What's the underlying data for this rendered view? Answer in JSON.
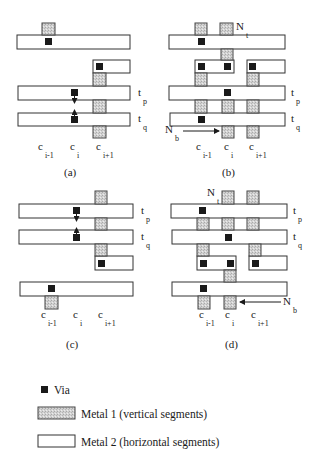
{
  "figure": {
    "panels": [
      {
        "id": "a",
        "caption": "(a)",
        "metal2": [
          {
            "x": 17,
            "y": 35,
            "w": 113,
            "h": 14
          },
          {
            "x": 93,
            "y": 60,
            "w": 37,
            "h": 13
          },
          {
            "x": 18,
            "y": 86,
            "w": 112,
            "h": 14
          },
          {
            "x": 18,
            "y": 113,
            "w": 112,
            "h": 13
          }
        ],
        "metal1": [
          {
            "x": 42,
            "y": 23,
            "w": 13,
            "h": 12
          },
          {
            "x": 93,
            "y": 73,
            "w": 13,
            "h": 13
          },
          {
            "x": 93,
            "y": 100,
            "w": 13,
            "h": 13
          },
          {
            "x": 93,
            "y": 126,
            "w": 13,
            "h": 12
          }
        ],
        "vias": [
          {
            "x": 45,
            "y": 38
          },
          {
            "x": 96,
            "y": 63
          },
          {
            "x": 71,
            "y": 89
          },
          {
            "x": 71,
            "y": 116
          }
        ],
        "arrows": [
          {
            "x1": 74.5,
            "y1": 96,
            "x2": 74.5,
            "y2": 103
          },
          {
            "x1": 74.5,
            "y1": 119,
            "x2": 74.5,
            "y2": 110
          }
        ],
        "track_labels": [
          {
            "main": "t",
            "sub": "p",
            "x": 138,
            "y": 96
          },
          {
            "main": "t",
            "sub": "q",
            "x": 138,
            "y": 122
          }
        ],
        "column_labels": [
          {
            "main": "c",
            "sub": "i-1",
            "x": 38,
            "y": 150
          },
          {
            "main": "c",
            "sub": "i",
            "x": 70,
            "y": 150
          },
          {
            "main": "c",
            "sub": "i+1",
            "x": 96,
            "y": 150
          }
        ],
        "net_labels": [],
        "caption_pos": {
          "x": 64,
          "y": 176
        }
      },
      {
        "id": "b",
        "caption": "(b)",
        "metal2": [
          {
            "x": 169,
            "y": 35,
            "w": 116,
            "h": 14
          },
          {
            "x": 195,
            "y": 60,
            "w": 39,
            "h": 13
          },
          {
            "x": 247,
            "y": 60,
            "w": 38,
            "h": 13
          },
          {
            "x": 169,
            "y": 86,
            "w": 116,
            "h": 14
          },
          {
            "x": 170,
            "y": 113,
            "w": 115,
            "h": 13
          }
        ],
        "metal1": [
          {
            "x": 195,
            "y": 23,
            "w": 12,
            "h": 12
          },
          {
            "x": 220,
            "y": 23,
            "w": 13,
            "h": 12
          },
          {
            "x": 221,
            "y": 49,
            "w": 12,
            "h": 11
          },
          {
            "x": 195,
            "y": 73,
            "w": 12,
            "h": 13
          },
          {
            "x": 247,
            "y": 73,
            "w": 12,
            "h": 13
          },
          {
            "x": 195,
            "y": 100,
            "w": 12,
            "h": 13
          },
          {
            "x": 222,
            "y": 100,
            "w": 12,
            "h": 13
          },
          {
            "x": 247,
            "y": 100,
            "w": 12,
            "h": 13
          },
          {
            "x": 222,
            "y": 126,
            "w": 12,
            "h": 12
          },
          {
            "x": 247,
            "y": 126,
            "w": 12,
            "h": 12
          }
        ],
        "vias": [
          {
            "x": 198,
            "y": 38
          },
          {
            "x": 198,
            "y": 63
          },
          {
            "x": 224,
            "y": 63
          },
          {
            "x": 249,
            "y": 63
          },
          {
            "x": 224,
            "y": 89
          },
          {
            "x": 198,
            "y": 116
          }
        ],
        "arrows": [
          {
            "x1": 183,
            "y1": 131,
            "x2": 219,
            "y2": 131
          }
        ],
        "track_labels": [
          {
            "main": "t",
            "sub": "p",
            "x": 291,
            "y": 96
          },
          {
            "main": "t",
            "sub": "q",
            "x": 291,
            "y": 122
          }
        ],
        "column_labels": [
          {
            "main": "c",
            "sub": "i-1",
            "x": 196,
            "y": 150
          },
          {
            "main": "c",
            "sub": "i",
            "x": 224,
            "y": 150
          },
          {
            "main": "c",
            "sub": "i+1",
            "x": 249,
            "y": 150
          }
        ],
        "net_labels": [
          {
            "main": "N",
            "sub": "t",
            "x": 236,
            "y": 30
          },
          {
            "main": "N",
            "sub": "b",
            "x": 165,
            "y": 133
          }
        ],
        "caption_pos": {
          "x": 222,
          "y": 176
        }
      },
      {
        "id": "c",
        "caption": "(c)",
        "metal2": [
          {
            "x": 19,
            "y": 204,
            "w": 114,
            "h": 14
          },
          {
            "x": 19,
            "y": 230,
            "w": 114,
            "h": 14
          },
          {
            "x": 95,
            "y": 256,
            "w": 38,
            "h": 14
          },
          {
            "x": 20,
            "y": 282,
            "w": 113,
            "h": 14
          }
        ],
        "metal1": [
          {
            "x": 95,
            "y": 191,
            "w": 12,
            "h": 13
          },
          {
            "x": 95,
            "y": 218,
            "w": 12,
            "h": 12
          },
          {
            "x": 95,
            "y": 244,
            "w": 12,
            "h": 12
          },
          {
            "x": 45,
            "y": 296,
            "w": 13,
            "h": 13
          }
        ],
        "vias": [
          {
            "x": 73,
            "y": 207
          },
          {
            "x": 73,
            "y": 234
          },
          {
            "x": 98,
            "y": 260
          },
          {
            "x": 48,
            "y": 285
          }
        ],
        "arrows": [
          {
            "x1": 76.5,
            "y1": 214,
            "x2": 76.5,
            "y2": 221
          },
          {
            "x1": 76.5,
            "y1": 237,
            "x2": 76.5,
            "y2": 228
          }
        ],
        "track_labels": [
          {
            "main": "t",
            "sub": "p",
            "x": 141,
            "y": 214
          },
          {
            "main": "t",
            "sub": "q",
            "x": 141,
            "y": 240
          }
        ],
        "column_labels": [
          {
            "main": "c",
            "sub": "i-1",
            "x": 41,
            "y": 318
          },
          {
            "main": "c",
            "sub": "i",
            "x": 73,
            "y": 318
          },
          {
            "main": "c",
            "sub": "i+1",
            "x": 98,
            "y": 318
          }
        ],
        "net_labels": [],
        "caption_pos": {
          "x": 66,
          "y": 348
        }
      },
      {
        "id": "d",
        "caption": "(d)",
        "metal2": [
          {
            "x": 171,
            "y": 204,
            "w": 116,
            "h": 14
          },
          {
            "x": 172,
            "y": 230,
            "w": 115,
            "h": 14
          },
          {
            "x": 197,
            "y": 256,
            "w": 39,
            "h": 14
          },
          {
            "x": 249,
            "y": 256,
            "w": 38,
            "h": 14
          },
          {
            "x": 172,
            "y": 282,
            "w": 115,
            "h": 14
          }
        ],
        "metal1": [
          {
            "x": 222,
            "y": 191,
            "w": 12,
            "h": 13
          },
          {
            "x": 247,
            "y": 191,
            "w": 12,
            "h": 13
          },
          {
            "x": 197,
            "y": 218,
            "w": 12,
            "h": 12
          },
          {
            "x": 222,
            "y": 218,
            "w": 12,
            "h": 12
          },
          {
            "x": 247,
            "y": 218,
            "w": 12,
            "h": 12
          },
          {
            "x": 197,
            "y": 244,
            "w": 12,
            "h": 12
          },
          {
            "x": 249,
            "y": 244,
            "w": 12,
            "h": 12
          },
          {
            "x": 224,
            "y": 270,
            "w": 12,
            "h": 12
          },
          {
            "x": 198,
            "y": 296,
            "w": 12,
            "h": 13
          },
          {
            "x": 224,
            "y": 296,
            "w": 12,
            "h": 13
          }
        ],
        "vias": [
          {
            "x": 199,
            "y": 207
          },
          {
            "x": 225,
            "y": 234
          },
          {
            "x": 200,
            "y": 260
          },
          {
            "x": 227,
            "y": 260
          },
          {
            "x": 252,
            "y": 260
          },
          {
            "x": 200,
            "y": 285
          }
        ],
        "arrows": [
          {
            "x1": 281,
            "y1": 302,
            "x2": 240,
            "y2": 302
          }
        ],
        "track_labels": [
          {
            "main": "t",
            "sub": "p",
            "x": 293,
            "y": 214
          },
          {
            "main": "t",
            "sub": "q",
            "x": 293,
            "y": 240
          }
        ],
        "column_labels": [
          {
            "main": "c",
            "sub": "i-1",
            "x": 199,
            "y": 318
          },
          {
            "main": "c",
            "sub": "i",
            "x": 225,
            "y": 318
          },
          {
            "main": "c",
            "sub": "i+1",
            "x": 251,
            "y": 318
          }
        ],
        "net_labels": [
          {
            "main": "N",
            "sub": "t",
            "x": 207,
            "y": 196
          },
          {
            "main": "N",
            "sub": "b",
            "x": 283,
            "y": 305
          }
        ],
        "caption_pos": {
          "x": 225,
          "y": 348
        }
      }
    ]
  },
  "legend": {
    "items": [
      {
        "kind": "via",
        "label": "Via"
      },
      {
        "kind": "metal1",
        "label": "Metal 1 (vertical segments)"
      },
      {
        "kind": "metal2",
        "label": "Metal 2 (horizontal segments)"
      }
    ]
  },
  "colors": {
    "via": "#1a1a1a",
    "metal1_fill": "#c8c8c8",
    "metal2_fill": "#ffffff",
    "stroke": "#333333"
  }
}
